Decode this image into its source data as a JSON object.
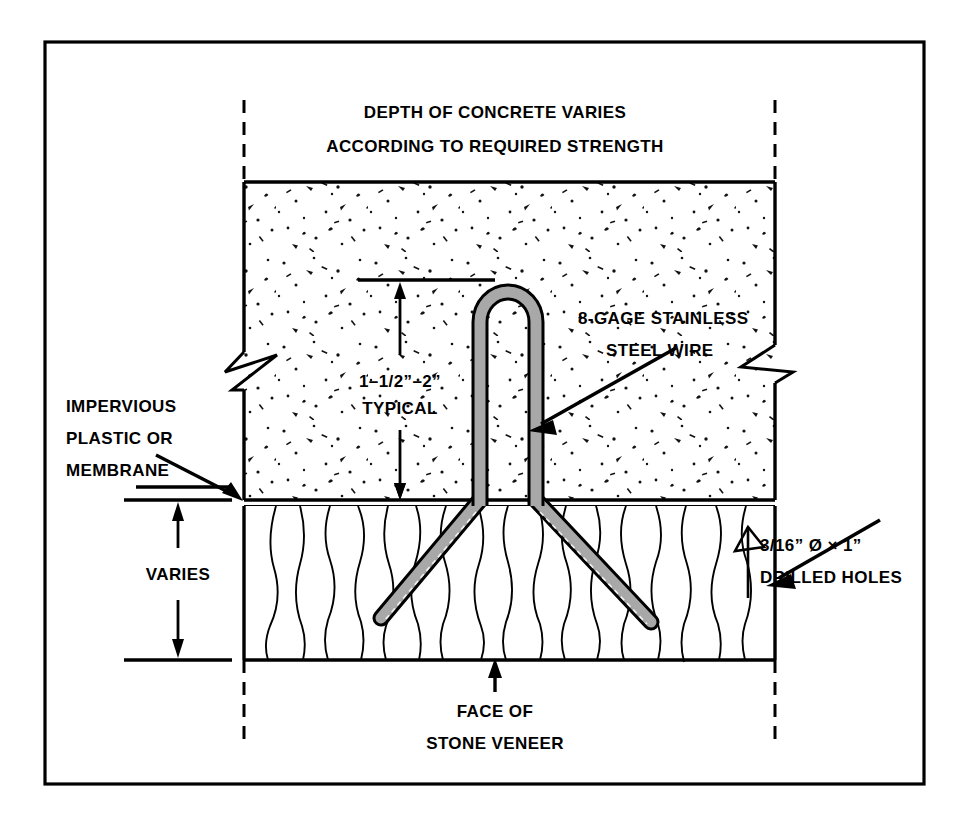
{
  "drawing": {
    "type": "architectural-detail",
    "subject": "Stone veneer anchor embedded in concrete",
    "border_color": "#000000",
    "concrete_fill": "#ffffff",
    "stone_fill": "#ffffff",
    "wire_fill": "#a8a8a8",
    "wire_outline": "#000000"
  },
  "labels": {
    "title_line1": "DEPTH OF CONCRETE VARIES",
    "title_line2": "ACCORDING TO REQUIRED STRENGTH",
    "wire_line1": "8-GAGE STAINLESS",
    "wire_line2": "STEEL WIRE",
    "cover_line1": "1–1/2”–2”",
    "cover_line2": "TYPICAL",
    "membrane_line1": "IMPERVIOUS",
    "membrane_line2": "PLASTIC  OR",
    "membrane_line3": "MEMBRANE",
    "varies": "VARIES",
    "holes_line1": "3/16” Ø × 1”",
    "holes_line2": "DRILLED HOLES",
    "face_line1": "FACE OF",
    "face_line2": "STONE VENEER"
  },
  "annotations": {
    "concrete_cover_dimension": "1–1/2”–2”",
    "drilled_hole_diameter": "3/16”",
    "drilled_hole_depth": "1”",
    "wire_gage": "8-GAGE",
    "wire_material": "STAINLESS STEEL",
    "stone_thickness": "VARIES",
    "concrete_depth": "VARIES"
  }
}
